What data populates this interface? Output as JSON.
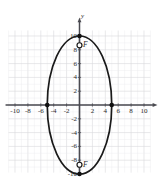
{
  "figure": {
    "name": "ellipse-graph",
    "axis_labels": {
      "y": "y"
    },
    "focus_labels": {
      "upper": "F",
      "lower": "F"
    }
  },
  "colors": {
    "background": "#ffffff",
    "grid": "#d8d8dc",
    "grid_minor": "#ebebee",
    "axis": "#4a4a50",
    "curve": "#1a1a1a",
    "point_fill": "#111111",
    "point_open_fill": "#ffffff",
    "text": "#2b2b2b"
  },
  "chart_data": {
    "type": "scatter",
    "title": "",
    "xlabel": "",
    "ylabel": "y",
    "xlim": [
      -11,
      11
    ],
    "ylim": [
      -11,
      11
    ],
    "grid": true,
    "grid_step": 1,
    "legend": "none",
    "x_ticks": [
      -10,
      -8,
      -6,
      -4,
      -2,
      2,
      4,
      6,
      8,
      10
    ],
    "x_tick_labels": [
      "-10",
      "-8",
      "-6",
      "-4",
      "-2",
      "2",
      "4",
      "6",
      "8",
      "10"
    ],
    "y_ticks": [
      10,
      8,
      6,
      4,
      2,
      -2,
      -4,
      -6,
      -8,
      -10
    ],
    "y_tick_labels": [
      "10",
      "8",
      "6",
      "4",
      "2",
      "-2",
      "-4",
      "-6",
      "-8",
      "-10"
    ],
    "curves": [
      {
        "name": "ellipse",
        "kind": "ellipse",
        "center": [
          0,
          0
        ],
        "semi_major_axis": 10,
        "semi_minor_axis": 5,
        "major_axis_orientation": "vertical"
      }
    ],
    "annotations": [
      {
        "name": "vertex-top",
        "x": 0,
        "y": 10,
        "marker": "filled-dot",
        "label": ""
      },
      {
        "name": "vertex-bottom",
        "x": 0,
        "y": -10,
        "marker": "filled-dot",
        "label": ""
      },
      {
        "name": "covertex-left",
        "x": -5,
        "y": 0,
        "marker": "filled-dot",
        "label": ""
      },
      {
        "name": "covertex-right",
        "x": 5,
        "y": 0,
        "marker": "filled-dot",
        "label": ""
      },
      {
        "name": "focus-upper",
        "x": 0,
        "y": 8.66,
        "marker": "open-circle",
        "label": "F"
      },
      {
        "name": "focus-lower",
        "x": 0,
        "y": -8.66,
        "marker": "open-circle",
        "label": "F"
      }
    ],
    "segments": [
      {
        "name": "major-axis-segment",
        "x1": 0,
        "y1": 10,
        "x2": 0,
        "y2": -10
      }
    ]
  }
}
